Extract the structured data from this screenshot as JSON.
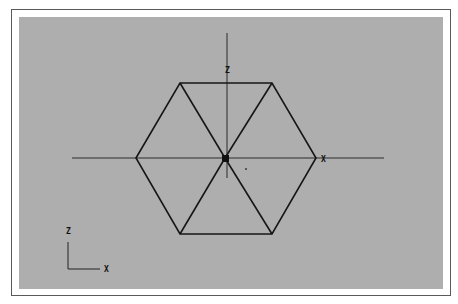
{
  "viewport": {
    "background": "#aeaeae",
    "line_color": "#161616"
  },
  "main_axes": {
    "vertical_label": "Z",
    "horizontal_label": "X"
  },
  "gizmo": {
    "vertical_label": "Z",
    "horizontal_label": "X"
  },
  "shape": {
    "type": "hexagon",
    "subdivision": "6 triangles from center",
    "center": [
      225,
      158
    ],
    "vertices": [
      [
        136,
        158
      ],
      [
        180,
        83
      ],
      [
        272,
        83
      ],
      [
        316,
        158
      ],
      [
        272,
        234
      ],
      [
        180,
        234
      ]
    ]
  }
}
